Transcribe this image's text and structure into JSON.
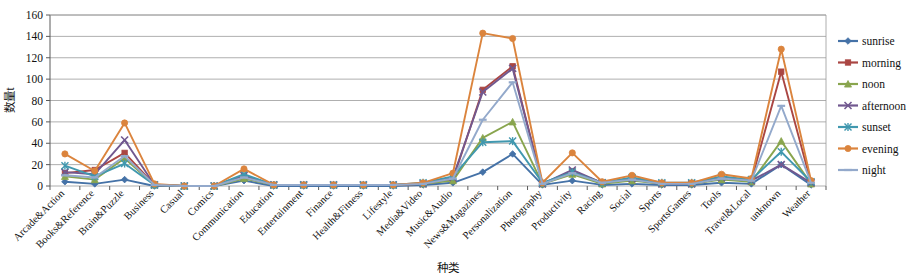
{
  "chart_data": {
    "type": "line",
    "title": "",
    "xlabel": "种类",
    "ylabel": "数量t",
    "ylim": [
      0,
      160
    ],
    "ytick_step": 20,
    "yticks": [
      0,
      20,
      40,
      60,
      80,
      100,
      120,
      140,
      160
    ],
    "grid": true,
    "legend_position": "right",
    "categories": [
      "Arcade&Action",
      "Books&Reference",
      "Brain&Puzzle",
      "Business",
      "Casual",
      "Comics",
      "Communication",
      "Education",
      "Entertainment",
      "Finance",
      "Health&Fitness",
      "Lifestyle",
      "Media&Video",
      "Music&Audio",
      "News&Magazines",
      "Personalization",
      "Photography",
      "Productivity",
      "Racing",
      "Social",
      "Sports",
      "SportsGames",
      "Tools",
      "Travel&Local",
      "unknown",
      "Weather"
    ],
    "series": [
      {
        "name": "sunrise",
        "color": "#4572A7",
        "marker": "diamond",
        "values": [
          4,
          2,
          6,
          0,
          0,
          0,
          5,
          0,
          0,
          0,
          0,
          0,
          1,
          3,
          13,
          30,
          1,
          5,
          1,
          2,
          1,
          1,
          3,
          2,
          20,
          1
        ]
      },
      {
        "name": "morning",
        "color": "#AA4643",
        "marker": "square",
        "values": [
          12,
          15,
          31,
          1,
          0,
          0,
          9,
          1,
          1,
          1,
          1,
          1,
          2,
          6,
          90,
          112,
          2,
          14,
          3,
          6,
          2,
          2,
          7,
          5,
          107,
          3
        ]
      },
      {
        "name": "noon",
        "color": "#89A54E",
        "marker": "triangle",
        "values": [
          9,
          6,
          26,
          1,
          0,
          0,
          7,
          1,
          1,
          1,
          1,
          1,
          2,
          5,
          45,
          60,
          2,
          11,
          2,
          5,
          2,
          2,
          6,
          4,
          42,
          2
        ]
      },
      {
        "name": "afternoon",
        "color": "#71588F",
        "marker": "cross",
        "values": [
          13,
          11,
          43,
          1,
          0,
          0,
          10,
          1,
          1,
          1,
          1,
          1,
          2,
          8,
          88,
          110,
          2,
          15,
          3,
          7,
          2,
          2,
          8,
          5,
          20,
          3
        ]
      },
      {
        "name": "sunset",
        "color": "#4198AF",
        "marker": "star",
        "values": [
          19,
          9,
          21,
          1,
          0,
          0,
          11,
          1,
          1,
          1,
          1,
          1,
          3,
          9,
          41,
          42,
          3,
          13,
          3,
          8,
          3,
          3,
          9,
          6,
          32,
          4
        ]
      },
      {
        "name": "evening",
        "color": "#DB843D",
        "marker": "circle",
        "values": [
          30,
          14,
          59,
          2,
          0,
          0,
          16,
          1,
          1,
          1,
          1,
          1,
          3,
          12,
          143,
          138,
          3,
          31,
          4,
          10,
          3,
          3,
          11,
          7,
          128,
          5
        ]
      },
      {
        "name": "night",
        "color": "#93A9CB",
        "marker": "line",
        "values": [
          10,
          8,
          28,
          1,
          0,
          0,
          8,
          1,
          1,
          1,
          1,
          1,
          2,
          7,
          62,
          97,
          2,
          12,
          3,
          6,
          2,
          2,
          7,
          5,
          75,
          3
        ]
      }
    ]
  },
  "legend": {
    "items": [
      {
        "label": "sunrise"
      },
      {
        "label": "morning"
      },
      {
        "label": "noon"
      },
      {
        "label": "afternoon"
      },
      {
        "label": "sunset"
      },
      {
        "label": "evening"
      },
      {
        "label": "night"
      }
    ]
  }
}
